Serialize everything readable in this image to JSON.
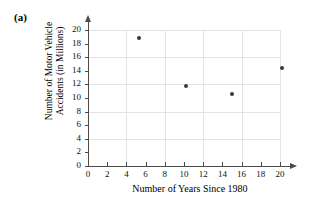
{
  "figure": {
    "panel_label": "(a)"
  },
  "chart_data": {
    "type": "scatter",
    "title": "",
    "xlabel": "Number of Years Since 1980",
    "ylabel_line1": "Number of Motor Vehicle",
    "ylabel_line2": "Accidents (in Millions)",
    "ylabel": "Number of Motor Vehicle Accidents (in Millions)",
    "xlim": [
      0,
      20
    ],
    "ylim": [
      0,
      20
    ],
    "xticks": [
      0,
      2,
      4,
      6,
      8,
      10,
      12,
      14,
      16,
      18,
      20
    ],
    "yticks": [
      0,
      2,
      4,
      6,
      8,
      10,
      12,
      14,
      16,
      18,
      20
    ],
    "xtick_labels": [
      "0",
      "2",
      "4",
      "6",
      "8",
      "10",
      "12",
      "14",
      "16",
      "18",
      "20"
    ],
    "ytick_labels": [
      "0",
      "2",
      "4",
      "6",
      "8",
      "10",
      "12",
      "14",
      "16",
      "18",
      "20"
    ],
    "grid": true,
    "grid_x": [
      4,
      8,
      12,
      16,
      20
    ],
    "grid_y": [
      4,
      8,
      12,
      16,
      20
    ],
    "grid_color": "#e4e4e6",
    "legend": null,
    "marker_color": "#3a3a3a",
    "axis_color": "#4a4a4a",
    "points": [
      {
        "x": 5.3,
        "y": 18.8
      },
      {
        "x": 10.2,
        "y": 11.8
      },
      {
        "x": 15.0,
        "y": 10.6
      },
      {
        "x": 20.2,
        "y": 14.4
      }
    ],
    "x": [
      5.3,
      10.2,
      15.0,
      20.2
    ],
    "values": [
      18.8,
      11.8,
      10.6,
      14.4
    ]
  }
}
